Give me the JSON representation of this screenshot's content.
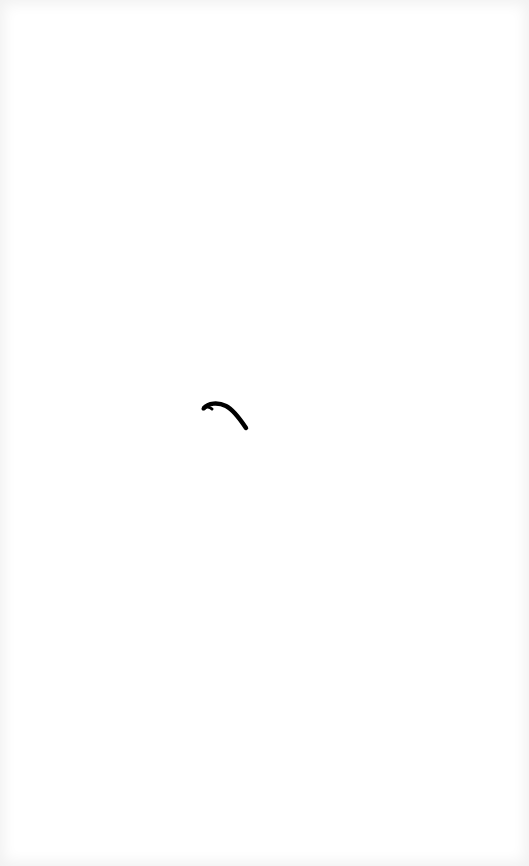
{
  "screen": {
    "state": "loading",
    "background_color": "#ffffff",
    "edge_shade_color": "#eeeeee"
  },
  "spinner": {
    "icon": "loading-spinner-arc",
    "color": "#000000"
  }
}
